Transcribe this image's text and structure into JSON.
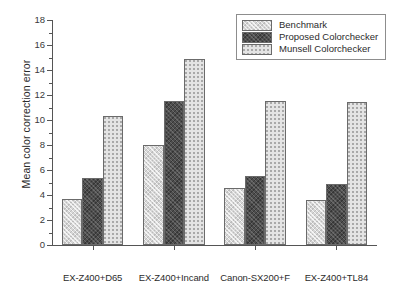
{
  "chart_data": {
    "type": "bar",
    "title": "",
    "xlabel": "",
    "ylabel": "Mean color correction error",
    "ylim": [
      0,
      18
    ],
    "ytick_step": 2,
    "yticks": [
      "0",
      "2",
      "4",
      "6",
      "8",
      "10",
      "12",
      "14",
      "16",
      "18"
    ],
    "grid": false,
    "legend_position": "top-right",
    "categories": [
      "EX-Z400+D65",
      "EX-Z400+Incand",
      "Canon-SX200+F",
      "EX-Z400+TL84"
    ],
    "series": [
      {
        "name": "Benchmark",
        "color": "#d6d6d6",
        "pattern": "diagonal-hatch",
        "values": [
          3.7,
          8.0,
          4.55,
          3.6
        ]
      },
      {
        "name": "Proposed Colorchecker",
        "color": "#4d4d4d",
        "pattern": "dark-cross-hatch",
        "values": [
          5.4,
          11.5,
          5.55,
          4.9
        ]
      },
      {
        "name": "Munsell Colorchecker",
        "color": "#e4e4e4",
        "pattern": "dotted",
        "values": [
          10.3,
          14.85,
          11.55,
          11.45
        ]
      }
    ]
  }
}
